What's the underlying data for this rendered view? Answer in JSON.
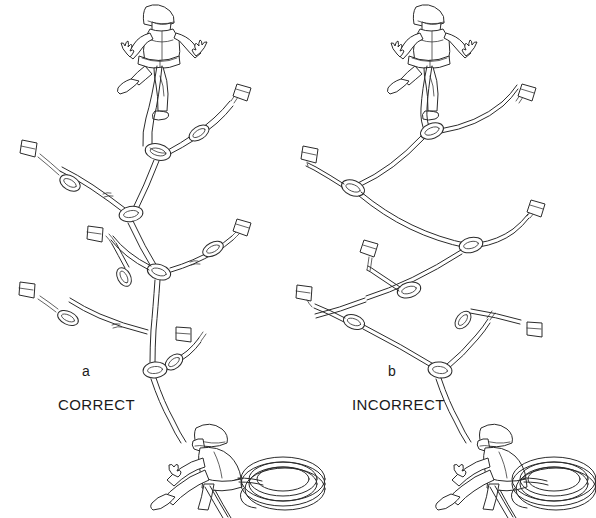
{
  "figure": {
    "background_color": "#ffffff",
    "line_color": "#2b2b2b",
    "width": 596,
    "height": 518,
    "style": "black-and-white line drawing"
  },
  "panels": [
    {
      "id": "panel-a",
      "letter": "a",
      "verdict": "CORRECT",
      "description": "Climbing anchor system with independent equalized legs forming Y junctions",
      "figures": {
        "climber": "climber-with-helmet-and-harness-arms-raised",
        "belayer": "seated-belayer-with-helmet-and-coiled-rope"
      },
      "protection_pieces": 5,
      "carabiners": 9
    },
    {
      "id": "panel-b",
      "letter": "b",
      "verdict": "INCORRECT",
      "description": "Climbing anchor system with pieces chained in series along sweeping rope arcs",
      "figures": {
        "climber": "climber-with-helmet-and-harness-arms-raised",
        "belayer": "seated-belayer-with-helmet-and-coiled-rope"
      },
      "protection_pieces": 5,
      "carabiners": 6
    }
  ]
}
